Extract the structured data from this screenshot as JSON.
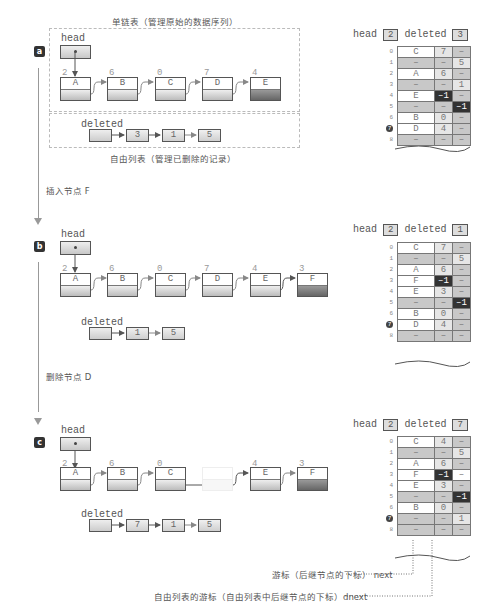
{
  "captions": {
    "linked_list": "单链表（管理原始的数据序列）",
    "free_list": "自由列表（管理已删除的记录）",
    "step_insert": "插入节点 F",
    "step_delete": "删除节点 D",
    "legend_next": "游标（后继节点的下标） next",
    "legend_dnext": "自由列表的游标（自由列表中后继节点的下标）dnext"
  },
  "labels": {
    "head": "head",
    "deleted": "deleted"
  },
  "panels": [
    {
      "badge": "a",
      "head_value": "2",
      "deleted_value": "3",
      "nodes": [
        {
          "index": "2",
          "data": "A"
        },
        {
          "index": "6",
          "data": "B"
        },
        {
          "index": "0",
          "data": "C"
        },
        {
          "index": "7",
          "data": "D"
        },
        {
          "index": "4",
          "data": "E",
          "tail": true
        }
      ],
      "free_list": [
        "3",
        "1",
        "5"
      ],
      "table": [
        {
          "row": "0",
          "data": "C",
          "next": "7",
          "dnext": "–"
        },
        {
          "row": "1",
          "data": "–",
          "next": "–",
          "dnext": "5"
        },
        {
          "row": "2",
          "data": "A",
          "next": "6",
          "dnext": "–"
        },
        {
          "row": "3",
          "data": "–",
          "next": "–",
          "dnext": "1"
        },
        {
          "row": "4",
          "data": "E",
          "next": "–1",
          "dnext": "–"
        },
        {
          "row": "5",
          "data": "–",
          "next": "–",
          "dnext": "–1"
        },
        {
          "row": "6",
          "data": "B",
          "next": "0",
          "dnext": "–"
        },
        {
          "row": "7",
          "data": "D",
          "next": "4",
          "dnext": "–"
        },
        {
          "row": "8",
          "data": "–",
          "next": "–",
          "dnext": "–"
        }
      ]
    },
    {
      "badge": "b",
      "head_value": "2",
      "deleted_value": "1",
      "nodes": [
        {
          "index": "2",
          "data": "A"
        },
        {
          "index": "6",
          "data": "B"
        },
        {
          "index": "0",
          "data": "C"
        },
        {
          "index": "7",
          "data": "D"
        },
        {
          "index": "4",
          "data": "E"
        },
        {
          "index": "3",
          "data": "F",
          "tail": true
        }
      ],
      "free_list": [
        "1",
        "5"
      ],
      "table": [
        {
          "row": "0",
          "data": "C",
          "next": "7",
          "dnext": "–"
        },
        {
          "row": "1",
          "data": "–",
          "next": "–",
          "dnext": "5"
        },
        {
          "row": "2",
          "data": "A",
          "next": "6",
          "dnext": "–"
        },
        {
          "row": "3",
          "data": "F",
          "next": "–1",
          "dnext": "–"
        },
        {
          "row": "4",
          "data": "E",
          "next": "3",
          "dnext": "–"
        },
        {
          "row": "5",
          "data": "–",
          "next": "–",
          "dnext": "–1"
        },
        {
          "row": "6",
          "data": "B",
          "next": "0",
          "dnext": "–"
        },
        {
          "row": "7",
          "data": "D",
          "next": "4",
          "dnext": "–"
        },
        {
          "row": "8",
          "data": "–",
          "next": "–",
          "dnext": "–"
        }
      ]
    },
    {
      "badge": "c",
      "head_value": "2",
      "deleted_value": "7",
      "nodes": [
        {
          "index": "2",
          "data": "A"
        },
        {
          "index": "6",
          "data": "B"
        },
        {
          "index": "0",
          "data": "C"
        },
        {
          "index": "",
          "data": "",
          "ghost": true
        },
        {
          "index": "4",
          "data": "E"
        },
        {
          "index": "3",
          "data": "F",
          "tail": true
        }
      ],
      "free_list": [
        "7",
        "1",
        "5"
      ],
      "table": [
        {
          "row": "0",
          "data": "C",
          "next": "4",
          "dnext": "–"
        },
        {
          "row": "1",
          "data": "–",
          "next": "–",
          "dnext": "5"
        },
        {
          "row": "2",
          "data": "A",
          "next": "6",
          "dnext": "–"
        },
        {
          "row": "3",
          "data": "F",
          "next": "–1",
          "dnext": "–"
        },
        {
          "row": "4",
          "data": "E",
          "next": "3",
          "dnext": "–"
        },
        {
          "row": "5",
          "data": "–",
          "next": "–",
          "dnext": "–1"
        },
        {
          "row": "6",
          "data": "B",
          "next": "0",
          "dnext": "–"
        },
        {
          "row": "7",
          "data": "–",
          "next": "–",
          "dnext": "1"
        },
        {
          "row": "8",
          "data": "–",
          "next": "–",
          "dnext": "–"
        }
      ]
    }
  ]
}
